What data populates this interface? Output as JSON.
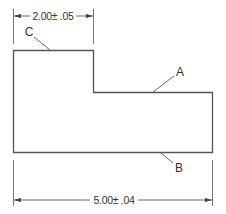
{
  "drawing": {
    "line_color": "#555555",
    "text_color": "#333333",
    "top_dimension": {
      "value": "2.00",
      "tolerance": "± .05",
      "label": "2.00± .05"
    },
    "bottom_dimension": {
      "value": "5.00",
      "tolerance": "± .04",
      "label": "5.00± .04"
    },
    "callouts": [
      {
        "id": "C",
        "label": "C",
        "refers_to": "top edge of upper block"
      },
      {
        "id": "A",
        "label": "A",
        "refers_to": "top edge of lower step"
      },
      {
        "id": "B",
        "label": "B",
        "refers_to": "bottom edge"
      }
    ]
  }
}
